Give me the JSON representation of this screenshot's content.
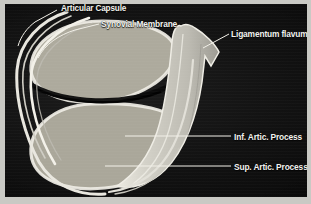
{
  "figure": {
    "kind": "anatomical-illustration",
    "background_color": "#0d0d0d",
    "frame_color": "#c9c9c4",
    "label_color": "#f2f2ee",
    "bone_color": "#b9b7ae",
    "cartilage_color": "#e8e6df",
    "ligament_color": "#cdcbc2",
    "joint_space_color": "#0a0a0a"
  },
  "labels": [
    {
      "id": "articular-capsule",
      "text": "Articular Capsule",
      "clipped_top": true
    },
    {
      "id": "synovial-membrane",
      "text": "Synovial Membrane",
      "clipped_top": false
    },
    {
      "id": "ligamentum-flavum",
      "text": "Ligamentum flavum",
      "clipped_top": false
    },
    {
      "id": "inf-artic-process",
      "text": "Inf. Artic. Process",
      "clipped_top": false
    },
    {
      "id": "sup-artic-process",
      "text": "Sup. Artic. Process",
      "clipped_top": false
    }
  ],
  "structures": [
    {
      "id": "superior-articular-process",
      "description": "upper bone process with trabecular texture"
    },
    {
      "id": "inferior-articular-process",
      "description": "lower bone process with trabecular texture"
    },
    {
      "id": "joint-space",
      "description": "dark cleft between articular surfaces"
    },
    {
      "id": "articular-capsule-band",
      "description": "outer white band wrapping the joint"
    },
    {
      "id": "synovial-membrane-band",
      "description": "inner white band lining the joint"
    },
    {
      "id": "ligamentum-flavum-body",
      "description": "pale vertical band right of the joint"
    }
  ]
}
